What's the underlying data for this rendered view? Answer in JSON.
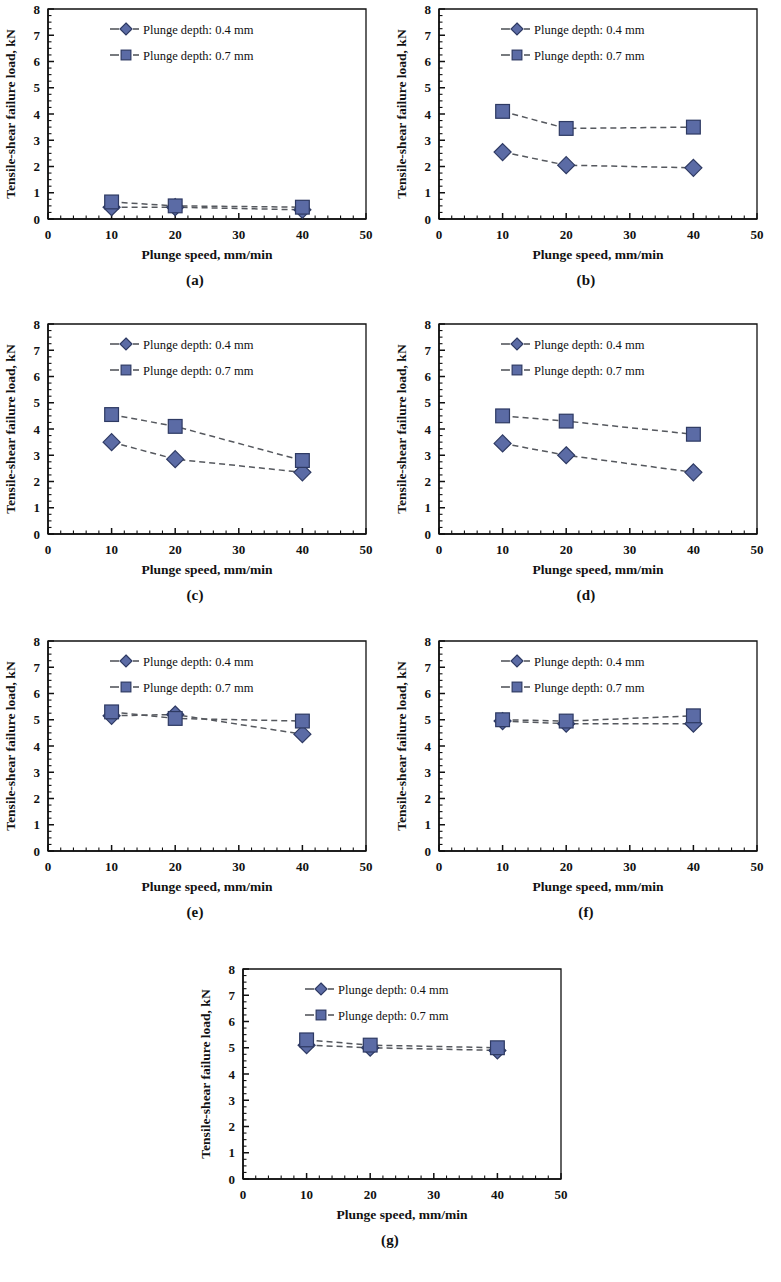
{
  "figure": {
    "panel_captions": [
      "(a)",
      "(b)",
      "(c)",
      "(d)",
      "(e)",
      "(f)",
      "(g)"
    ],
    "axis": {
      "xlabel": "Plunge speed, mm/min",
      "ylabel": "Tensile-shear failure load, kN",
      "xticks": [
        "0",
        "10",
        "20",
        "30",
        "40",
        "50"
      ],
      "yticks": [
        "0",
        "1",
        "2",
        "3",
        "4",
        "5",
        "6",
        "7",
        "8"
      ],
      "xlim": [
        0,
        50
      ],
      "ylim": [
        0,
        8
      ]
    },
    "legend": {
      "series1_label": "Plunge depth: 0.4 mm",
      "series2_label": "Plunge depth: 0.7 mm",
      "series1_marker": "diamond-marker",
      "series2_marker": "square-marker"
    },
    "colors": {
      "marker_fill": "#5b6ba5",
      "marker_stroke": "#2e3a63",
      "line": "#55585e",
      "axis": "#111111",
      "background": "#ffffff"
    }
  },
  "chart_data": [
    {
      "type": "line",
      "panel": "(a)",
      "title": "",
      "xlabel": "Plunge speed, mm/min",
      "ylabel": "Tensile-shear failure load, kN",
      "x": [
        10,
        20,
        40
      ],
      "xlim": [
        0,
        50
      ],
      "ylim": [
        0,
        8
      ],
      "grid": false,
      "legend_position": "top-center",
      "series": [
        {
          "name": "Plunge depth: 0.4 mm",
          "marker": "diamond",
          "values": [
            0.45,
            0.45,
            0.35
          ]
        },
        {
          "name": "Plunge depth: 0.7 mm",
          "marker": "square",
          "values": [
            0.65,
            0.5,
            0.45
          ]
        }
      ]
    },
    {
      "type": "line",
      "panel": "(b)",
      "title": "",
      "xlabel": "Plunge speed, mm/min",
      "ylabel": "Tensile-shear failure load, kN",
      "x": [
        10,
        20,
        40
      ],
      "xlim": [
        0,
        50
      ],
      "ylim": [
        0,
        8
      ],
      "grid": false,
      "legend_position": "top-center",
      "series": [
        {
          "name": "Plunge depth: 0.4 mm",
          "marker": "diamond",
          "values": [
            2.55,
            2.05,
            1.95
          ]
        },
        {
          "name": "Plunge depth: 0.7 mm",
          "marker": "square",
          "values": [
            4.1,
            3.45,
            3.5
          ]
        }
      ]
    },
    {
      "type": "line",
      "panel": "(c)",
      "title": "",
      "xlabel": "Plunge speed, mm/min",
      "ylabel": "Tensile-shear failure load, kN",
      "x": [
        10,
        20,
        40
      ],
      "xlim": [
        0,
        50
      ],
      "ylim": [
        0,
        8
      ],
      "grid": false,
      "legend_position": "top-center",
      "series": [
        {
          "name": "Plunge depth: 0.4 mm",
          "marker": "diamond",
          "values": [
            3.5,
            2.85,
            2.35
          ]
        },
        {
          "name": "Plunge depth: 0.7 mm",
          "marker": "square",
          "values": [
            4.55,
            4.1,
            2.8
          ]
        }
      ]
    },
    {
      "type": "line",
      "panel": "(d)",
      "title": "",
      "xlabel": "Plunge speed, mm/min",
      "ylabel": "Tensile-shear failure load, kN",
      "x": [
        10,
        20,
        40
      ],
      "xlim": [
        0,
        50
      ],
      "ylim": [
        0,
        8
      ],
      "grid": false,
      "legend_position": "top-center",
      "series": [
        {
          "name": "Plunge depth: 0.4 mm",
          "marker": "diamond",
          "values": [
            3.45,
            3.0,
            2.35
          ]
        },
        {
          "name": "Plunge depth: 0.7 mm",
          "marker": "square",
          "values": [
            4.5,
            4.3,
            3.8
          ]
        }
      ]
    },
    {
      "type": "line",
      "panel": "(e)",
      "title": "",
      "xlabel": "Plunge speed, mm/min",
      "ylabel": "Tensile-shear failure load, kN",
      "x": [
        10,
        20,
        40
      ],
      "xlim": [
        0,
        50
      ],
      "ylim": [
        0,
        8
      ],
      "grid": false,
      "legend_position": "top-center",
      "series": [
        {
          "name": "Plunge depth: 0.4 mm",
          "marker": "diamond",
          "values": [
            5.15,
            5.2,
            4.45
          ]
        },
        {
          "name": "Plunge depth: 0.7 mm",
          "marker": "square",
          "values": [
            5.3,
            5.05,
            4.95
          ]
        }
      ]
    },
    {
      "type": "line",
      "panel": "(f)",
      "title": "",
      "xlabel": "Plunge speed, mm/min",
      "ylabel": "Tensile-shear failure load, kN",
      "x": [
        10,
        20,
        40
      ],
      "xlim": [
        0,
        50
      ],
      "ylim": [
        0,
        8
      ],
      "grid": false,
      "legend_position": "top-center",
      "series": [
        {
          "name": "Plunge depth: 0.4 mm",
          "marker": "diamond",
          "values": [
            4.95,
            4.85,
            4.85
          ]
        },
        {
          "name": "Plunge depth: 0.7 mm",
          "marker": "square",
          "values": [
            5.0,
            4.95,
            5.15
          ]
        }
      ]
    },
    {
      "type": "line",
      "panel": "(g)",
      "title": "",
      "xlabel": "Plunge speed, mm/min",
      "ylabel": "Tensile-shear failure load, kN",
      "x": [
        10,
        20,
        40
      ],
      "xlim": [
        0,
        50
      ],
      "ylim": [
        0,
        8
      ],
      "grid": false,
      "legend_position": "top-center",
      "series": [
        {
          "name": "Plunge depth: 0.4 mm",
          "marker": "diamond",
          "values": [
            5.1,
            5.0,
            4.9
          ]
        },
        {
          "name": "Plunge depth: 0.7 mm",
          "marker": "square",
          "values": [
            5.3,
            5.1,
            5.0
          ]
        }
      ]
    }
  ]
}
